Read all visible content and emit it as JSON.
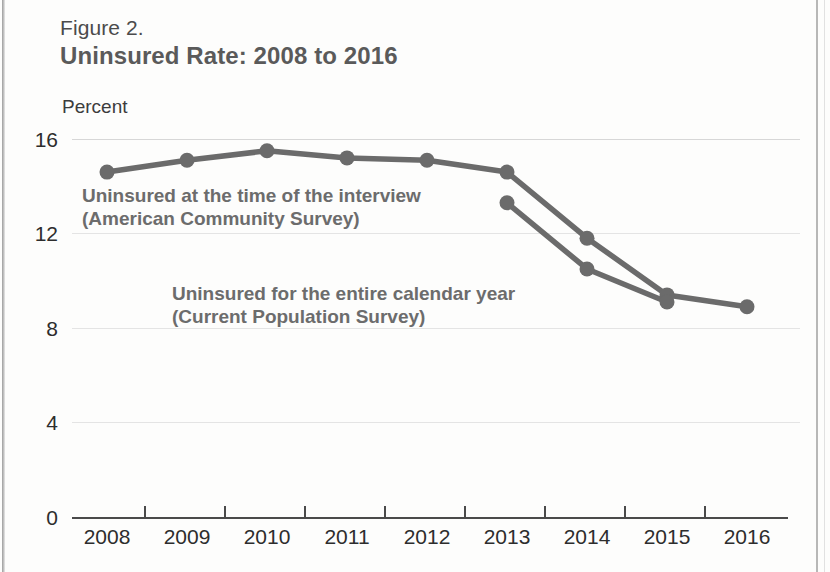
{
  "figure": {
    "label": "Figure 2.",
    "title": "Uninsured Rate: 2008 to 2016",
    "axis_title": "Percent"
  },
  "annotations": {
    "acs_line1": "Uninsured at the time of the interview",
    "acs_line2": "(American Community Survey)",
    "cps_line1": "Uninsured for the entire calendar year",
    "cps_line2": "(Current Population Survey)"
  },
  "colors": {
    "line": "#6b6b6b",
    "text": "#5a5a5a",
    "axis": "#4a4a4a",
    "grid": "#d7d7d7"
  },
  "chart_data": {
    "type": "line",
    "title": "Uninsured Rate: 2008 to 2016",
    "subtitle": "Figure 2.",
    "xlabel": "",
    "ylabel": "Percent",
    "x": [
      "2008",
      "2009",
      "2010",
      "2011",
      "2012",
      "2013",
      "2014",
      "2015",
      "2016"
    ],
    "xtick_labels": [
      "2008",
      "2009",
      "2010",
      "2011",
      "2012",
      "2013",
      "2014",
      "2015",
      "2016"
    ],
    "ytick_labels": [
      "0",
      "4",
      "8",
      "12",
      "16"
    ],
    "yticks": [
      0,
      4,
      8,
      12,
      16
    ],
    "ylim": [
      0,
      16
    ],
    "grid": "horizontal",
    "legend": "inline-annotations",
    "series": [
      {
        "name": "Uninsured at the time of the interview (American Community Survey)",
        "short_name": "American Community Survey",
        "x": [
          "2008",
          "2009",
          "2010",
          "2011",
          "2012",
          "2013",
          "2014",
          "2015",
          "2016"
        ],
        "values": [
          14.6,
          15.1,
          15.5,
          15.2,
          15.1,
          14.6,
          11.8,
          9.4,
          8.9
        ],
        "color": "#6b6b6b",
        "markers": true
      },
      {
        "name": "Uninsured for the entire calendar year (Current Population Survey)",
        "short_name": "Current Population Survey",
        "x": [
          "2013",
          "2014",
          "2015"
        ],
        "values": [
          13.3,
          10.5,
          9.1
        ],
        "color": "#6b6b6b",
        "markers": true
      }
    ]
  }
}
